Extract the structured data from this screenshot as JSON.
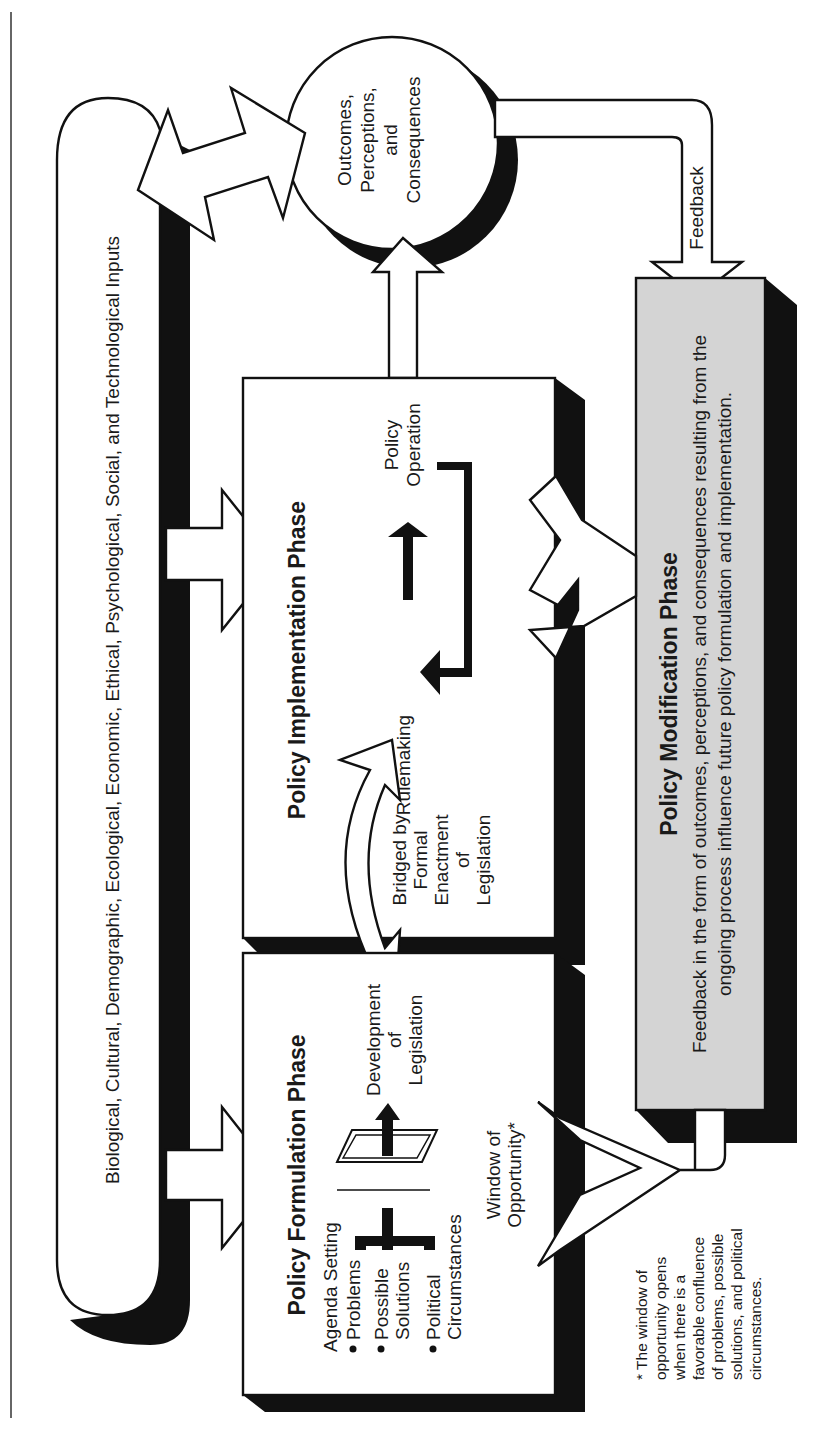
{
  "diagram": {
    "orientation": "rotated 90 degrees counter-clockwise",
    "inputs_band": {
      "label": "Biological, Cultural, Demographic, Ecological, Economic, Ethical, Psychological, Social, and Technological Inputs"
    },
    "outcomes_circle": {
      "lines": [
        "Outcomes,",
        "Perceptions,",
        "and",
        "Consequences"
      ]
    },
    "feedback_arrow": {
      "label": "Feedback"
    },
    "formulation_phase": {
      "title": "Policy Formulation Phase",
      "subtitle": "Agenda Setting",
      "bullets": [
        {
          "lines": [
            "Problems"
          ]
        },
        {
          "lines": [
            "Possible",
            "Solutions"
          ]
        },
        {
          "lines": [
            "Political",
            "Circumstances"
          ]
        }
      ],
      "output_lines": [
        "Development",
        "of",
        "Legislation"
      ],
      "window_lines": [
        "Window of",
        "Opportunity*"
      ]
    },
    "bridge": {
      "lines": [
        "Bridged by",
        "Formal",
        "Enactment",
        "of",
        "Legislation"
      ]
    },
    "implementation_phase": {
      "title": "Policy Implementation Phase",
      "left_label": "Rulemaking",
      "right_lines": [
        "Policy",
        "Operation"
      ]
    },
    "modification_phase": {
      "title": "Policy Modification Phase",
      "lines": [
        "Feedback in the form of outcomes, perceptions, and consequences resulting from the",
        "ongoing process influence future policy formulation and implementation."
      ],
      "fill_color": "#d4d4d4"
    },
    "footnote": {
      "lines": [
        "* The window of",
        "opportunity opens",
        "when there is a",
        "favorable confluence",
        "of problems, possible",
        "solutions, and political",
        "circumstances."
      ]
    }
  }
}
